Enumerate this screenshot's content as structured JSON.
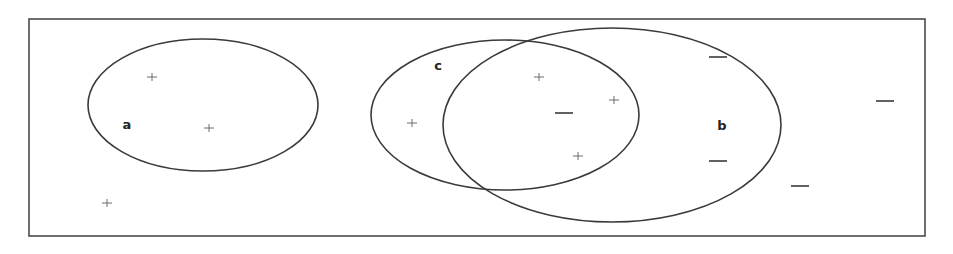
{
  "diagram": {
    "type": "venn-diagram",
    "frame": {
      "x": 29,
      "y": 19,
      "width": 896,
      "height": 217,
      "stroke": "#4a4a4a"
    },
    "sets": [
      {
        "id": "a",
        "label": "a",
        "cx": 203,
        "cy": 105,
        "rx": 115,
        "ry": 66,
        "label_x": 127,
        "label_y": 129
      },
      {
        "id": "c",
        "label": "c",
        "cx": 505,
        "cy": 115,
        "rx": 134,
        "ry": 75,
        "label_x": 438,
        "label_y": 70
      },
      {
        "id": "b",
        "label": "b",
        "cx": 612,
        "cy": 125,
        "rx": 169,
        "ry": 97,
        "label_x": 722,
        "label_y": 130
      }
    ],
    "points": [
      {
        "type": "plus",
        "x": 152,
        "y": 77,
        "region": "a"
      },
      {
        "type": "plus",
        "x": 209,
        "y": 128,
        "region": "a"
      },
      {
        "type": "plus",
        "x": 107,
        "y": 203,
        "region": "outside"
      },
      {
        "type": "plus",
        "x": 412,
        "y": 123,
        "region": "c"
      },
      {
        "type": "plus",
        "x": 539,
        "y": 77,
        "region": "b∩c"
      },
      {
        "type": "plus",
        "x": 614,
        "y": 100,
        "region": "b∩c"
      },
      {
        "type": "minus",
        "x": 564,
        "y": 113,
        "region": "b∩c"
      },
      {
        "type": "plus",
        "x": 578,
        "y": 156,
        "region": "b∩c"
      },
      {
        "type": "minus",
        "x": 718,
        "y": 57,
        "region": "b"
      },
      {
        "type": "minus",
        "x": 718,
        "y": 161,
        "region": "b"
      },
      {
        "type": "minus",
        "x": 800,
        "y": 186,
        "region": "outside"
      },
      {
        "type": "minus",
        "x": 885,
        "y": 101,
        "region": "outside"
      }
    ],
    "symbols": {
      "plus": "+",
      "minus": "—"
    },
    "colors": {
      "stroke": "#3a3a3a",
      "label": "#222222",
      "plus": "#6a6a6a",
      "background": "#ffffff"
    }
  }
}
